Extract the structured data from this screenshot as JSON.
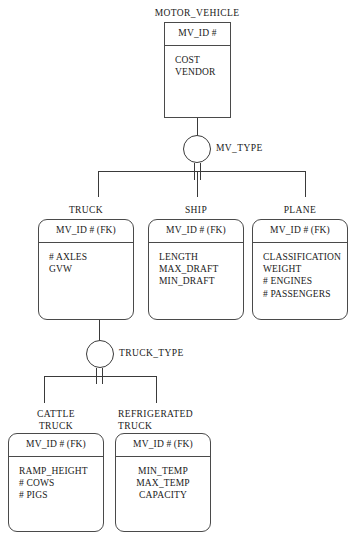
{
  "diagram": {
    "notation": "IE / subtype discriminator ER diagram",
    "colors": {
      "background": "#ffffff",
      "line": "#3a3a3a",
      "box_border": "#4a4a4a",
      "text": "#1a1a1a"
    }
  },
  "entities": {
    "motor_vehicle": {
      "name": "MOTOR_VEHICLE",
      "key": "MV_ID #",
      "attributes": [
        "COST",
        "VENDOR"
      ]
    },
    "truck": {
      "name": "TRUCK",
      "key": "MV_ID # (FK)",
      "attributes": [
        "# AXLES",
        "GVW"
      ]
    },
    "ship": {
      "name": "SHIP",
      "key": "MV_ID # (FK)",
      "attributes": [
        "LENGTH",
        "MAX_DRAFT",
        "MIN_DRAFT"
      ]
    },
    "plane": {
      "name": "PLANE",
      "key": "MV_ID # (FK)",
      "attributes": [
        "CLASSIFICATION",
        "WEIGHT",
        "# ENGINES",
        "# PASSENGERS"
      ]
    },
    "cattle_truck": {
      "name_line1": "CATTLE",
      "name_line2": "TRUCK",
      "key": "MV_ID # (FK)",
      "attributes": [
        "RAMP_HEIGHT",
        "# COWS",
        "# PIGS"
      ]
    },
    "refrigerated_truck": {
      "name_line1": "REFRIGERATED",
      "name_line2": "TRUCK",
      "key": "MV_ID # (FK)",
      "attributes": [
        "MIN_TEMP",
        "MAX_TEMP",
        "CAPACITY"
      ]
    }
  },
  "discriminators": {
    "mv_type": {
      "label": "MV_TYPE"
    },
    "truck_type": {
      "label": "TRUCK_TYPE"
    }
  }
}
